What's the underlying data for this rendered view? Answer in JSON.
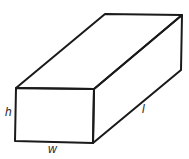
{
  "diagram": {
    "type": "rectangular-prism",
    "labels": {
      "height": "h",
      "width": "w",
      "length": "l"
    },
    "colors": {
      "stroke": "#1a1a1a",
      "label": "#2a2a2a",
      "background": "#ffffff"
    }
  }
}
